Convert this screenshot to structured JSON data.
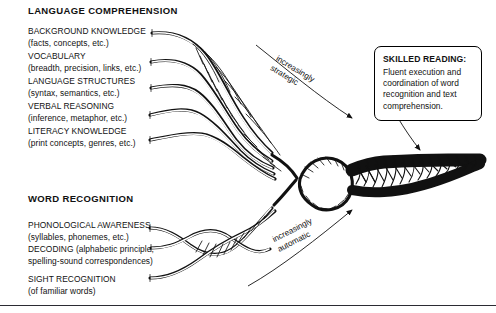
{
  "diagram": {
    "accent_color": "#111111",
    "background_color": "#ffffff"
  },
  "upper_section": {
    "heading": "LANGUAGE COMPREHENSION",
    "strands": [
      {
        "title": "BACKGROUND KNOWLEDGE",
        "detail": "(facts, concepts, etc.)"
      },
      {
        "title": "VOCABULARY",
        "detail": "(breadth, precision, links, etc.)"
      },
      {
        "title": "LANGUAGE STRUCTURES",
        "detail": "(syntax, semantics, etc.)"
      },
      {
        "title": "VERBAL REASONING",
        "detail": "(inference, metaphor, etc.)"
      },
      {
        "title": "LITERACY KNOWLEDGE",
        "detail": "(print concepts, genres, etc.)"
      }
    ]
  },
  "lower_section": {
    "heading": "WORD RECOGNITION",
    "strands": [
      {
        "title": "PHONOLOGICAL AWARENESS",
        "detail": "(syllables, phonemes, etc.)"
      },
      {
        "title": "DECODING (alphabetic principle,",
        "detail": "spelling-sound correspondences)"
      },
      {
        "title": "SIGHT RECOGNITION",
        "detail": "(of familiar words)"
      }
    ]
  },
  "callout": {
    "title": "SKILLED READING:",
    "body": "Fluent execution and coordination of word recognition and text comprehension."
  },
  "axis_labels": {
    "upper_line1": "increasingly",
    "upper_line2": "strategic",
    "lower_line1": "increasingly",
    "lower_line2": "automatic"
  }
}
